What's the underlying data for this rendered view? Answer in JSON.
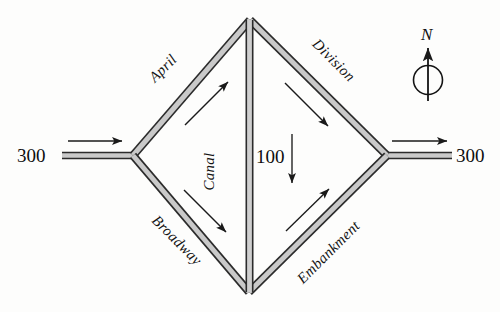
{
  "figure": {
    "type": "road-network-diagram",
    "background_color": "#fdfdfc",
    "road_edge_color": "#2b2b2b",
    "road_fill_color": "#c9c9c9",
    "arrow_color": "#1a1a1a",
    "text_color": "#111111"
  },
  "roads": [
    {
      "id": "april",
      "label": "April",
      "orientation": "northeast",
      "label_rotation_deg": -45,
      "flow_direction": "up-right"
    },
    {
      "id": "division",
      "label": "Division",
      "orientation": "southeast",
      "label_rotation_deg": 45,
      "flow_direction": "down-right"
    },
    {
      "id": "broadway",
      "label": "Broadway",
      "orientation": "southeast",
      "label_rotation_deg": 45,
      "flow_direction": "down-right"
    },
    {
      "id": "embankment",
      "label": "Embankment",
      "orientation": "northeast",
      "label_rotation_deg": -45,
      "flow_direction": "up-right"
    },
    {
      "id": "canal",
      "label": "Canal",
      "orientation": "vertical",
      "label_rotation_deg": -90,
      "flow_direction": "down"
    }
  ],
  "flows": {
    "inbound_west": "300",
    "outbound_east": "300",
    "canal": "100"
  },
  "compass": {
    "letter": "N",
    "points": "up"
  }
}
